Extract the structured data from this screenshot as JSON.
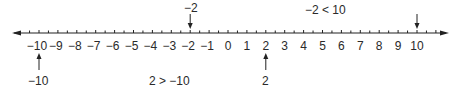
{
  "number_line": {
    "min": -10,
    "max": 10,
    "tick_labels": [
      "−10",
      "−9",
      "−8",
      "−7",
      "−6",
      "−5",
      "−4",
      "−3",
      "−2",
      "−1",
      "0",
      "1",
      "2",
      "3",
      "4",
      "5",
      "6",
      "7",
      "8",
      "9",
      "10"
    ],
    "minor_ticks_per_unit": 2,
    "arrows_both_ends": true
  },
  "markers": [
    {
      "value": -2,
      "label": "−2",
      "direction": "down",
      "label_position": "above"
    },
    {
      "value": 10,
      "label": "",
      "direction": "down",
      "label_position": "above"
    },
    {
      "value": 2,
      "label": "2",
      "direction": "up",
      "label_position": "below"
    },
    {
      "value": -10,
      "label": "−10",
      "direction": "up",
      "label_position": "below"
    }
  ],
  "annotations": {
    "top_right": "−2 < 10",
    "bottom_middle": "2 > −10"
  },
  "colors": {
    "line": "#222222",
    "text": "#2a2a2a",
    "background": "#ffffff"
  }
}
